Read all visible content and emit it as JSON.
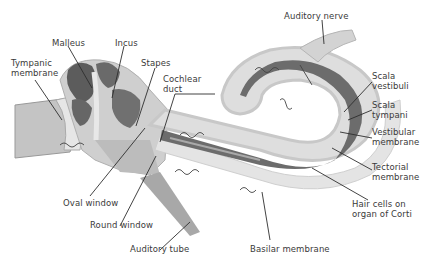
{
  "diagram": {
    "labels": {
      "malleus": "Malleus",
      "incus": "Incus",
      "tympanic_membrane": "Tympanic\nmembrane",
      "stapes": "Stapes",
      "cochlear_duct": "Cochlear\nduct",
      "auditory_nerve": "Auditory nerve",
      "scala_vestibuli": "Scala\nvestibuli",
      "scala_tympani": "Scala\ntympani",
      "vestibular_membrane": "Vestibular\nmembrane",
      "tectorial_membrane": "Tectorial\nmembrane",
      "hair_cells": "Hair cells on\norgan of Corti",
      "oval_window": "Oval window",
      "round_window": "Round window",
      "auditory_tube": "Auditory tube",
      "basilar_membrane": "Basilar membrane"
    },
    "colors": {
      "ear_canal": "#bdbdbd",
      "ossicle_dark": "#5e5e5e",
      "bone_light": "#d6d6d6",
      "fluid": "#e2e2e2",
      "duct_dark": "#6a6a6a",
      "line": "#2e2e2e"
    }
  }
}
